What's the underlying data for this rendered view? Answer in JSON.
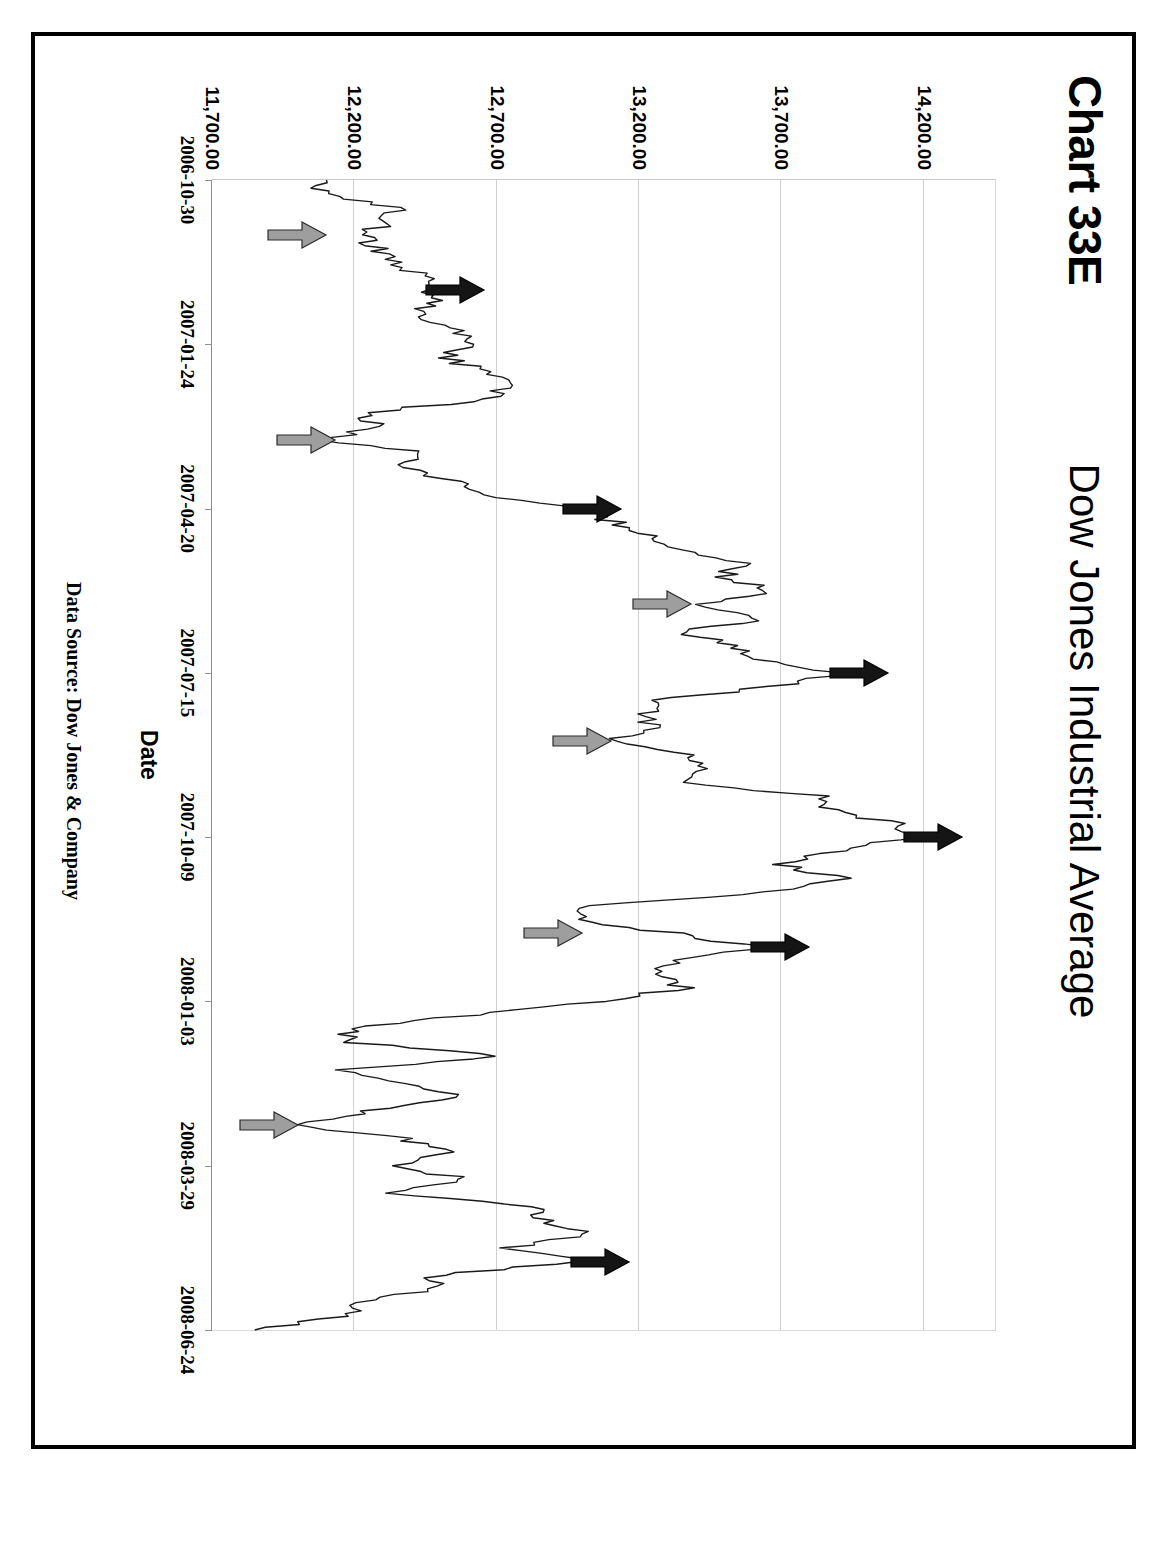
{
  "figure": {
    "chart_number": "Chart 33E",
    "title": "Dow Jones Industrial Average",
    "source_note": "Data Source:  Dow Jones & Company"
  },
  "chart_data": {
    "type": "line",
    "title": "Dow Jones Industrial Average",
    "xlabel": "Date",
    "ylabel": "Dow Industrials",
    "grid": true,
    "legend": "none",
    "orientation": "rotated-90-ccw",
    "ylim": [
      11700,
      14450
    ],
    "ytick_labels": [
      "14,200.00",
      "13,700.00",
      "13,200.00",
      "12,700.00",
      "12,200.00",
      "11,700.00"
    ],
    "ytick_values": [
      14200,
      13700,
      13200,
      12700,
      12200,
      11700
    ],
    "xtick_labels": [
      "2006-10-30",
      "2007-01-24",
      "2007-04-20",
      "2007-07-15",
      "2007-10-09",
      "2008-01-03",
      "2008-03-29",
      "2008-06-24"
    ],
    "series_name": "Dow Jones Industrial Average daily close",
    "x": [
      "2006-10-30",
      "2006-11-06",
      "2006-11-13",
      "2006-11-20",
      "2006-11-27",
      "2006-12-04",
      "2006-12-11",
      "2006-12-18",
      "2006-12-26",
      "2007-01-03",
      "2007-01-10",
      "2007-01-17",
      "2007-01-24",
      "2007-01-31",
      "2007-02-07",
      "2007-02-14",
      "2007-02-22",
      "2007-03-01",
      "2007-03-08",
      "2007-03-15",
      "2007-03-22",
      "2007-03-29",
      "2007-04-05",
      "2007-04-13",
      "2007-04-20",
      "2007-04-27",
      "2007-05-04",
      "2007-05-11",
      "2007-05-18",
      "2007-05-25",
      "2007-06-04",
      "2007-06-11",
      "2007-06-18",
      "2007-06-25",
      "2007-07-02",
      "2007-07-09",
      "2007-07-15",
      "2007-07-23",
      "2007-07-30",
      "2007-08-06",
      "2007-08-13",
      "2007-08-20",
      "2007-08-27",
      "2007-09-04",
      "2007-09-11",
      "2007-09-18",
      "2007-09-25",
      "2007-10-02",
      "2007-10-09",
      "2007-10-16",
      "2007-10-23",
      "2007-10-30",
      "2007-11-06",
      "2007-11-13",
      "2007-11-20",
      "2007-11-28",
      "2007-12-05",
      "2007-12-12",
      "2007-12-19",
      "2007-12-27",
      "2008-01-03",
      "2008-01-10",
      "2008-01-17",
      "2008-01-25",
      "2008-02-01",
      "2008-02-08",
      "2008-02-15",
      "2008-02-25",
      "2008-03-03",
      "2008-03-10",
      "2008-03-18",
      "2008-03-26",
      "2008-03-29",
      "2008-04-04",
      "2008-04-11",
      "2008-04-18",
      "2008-04-25",
      "2008-05-02",
      "2008-05-09",
      "2008-05-16",
      "2008-05-23",
      "2008-06-02",
      "2008-06-09",
      "2008-06-16",
      "2008-06-24"
    ],
    "values": [
      12080,
      12105,
      12340,
      12320,
      12220,
      12290,
      12320,
      12450,
      12480,
      12470,
      12420,
      12560,
      12620,
      12520,
      12650,
      12740,
      12690,
      12230,
      12280,
      12110,
      12460,
      12350,
      12560,
      12610,
      12960,
      13120,
      13260,
      13330,
      13560,
      13500,
      13680,
      13420,
      13640,
      13360,
      13530,
      13610,
      13900,
      13680,
      13270,
      13230,
      13240,
      13080,
      13380,
      13450,
      13310,
      13850,
      13880,
      14090,
      14160,
      13900,
      13680,
      13900,
      13660,
      13010,
      12980,
      13310,
      13620,
      13340,
      13230,
      13360,
      13050,
      12600,
      12160,
      12210,
      12740,
      12180,
      12350,
      12570,
      12260,
      11980,
      12360,
      12550,
      12320,
      12600,
      12330,
      12850,
      12870,
      13020,
      12750,
      12990,
      12480,
      12500,
      12210,
      12160,
      11850
    ],
    "annotations": {
      "peak_arrows_black": [
        {
          "label": "peak-1",
          "date": "2006-12-26",
          "value": 12480
        },
        {
          "label": "peak-2",
          "date": "2007-04-20",
          "value": 12960
        },
        {
          "label": "peak-3",
          "date": "2007-07-15",
          "value": 13900
        },
        {
          "label": "peak-4",
          "date": "2007-10-09",
          "value": 14160
        },
        {
          "label": "peak-5",
          "date": "2007-12-05",
          "value": 13620
        },
        {
          "label": "peak-6",
          "date": "2008-05-16",
          "value": 12990
        }
      ],
      "trough_arrows_gray": [
        {
          "label": "trough-1",
          "date": "2006-11-27",
          "value": 12080
        },
        {
          "label": "trough-2",
          "date": "2007-03-15",
          "value": 12110
        },
        {
          "label": "trough-3",
          "date": "2007-06-11",
          "value": 13360
        },
        {
          "label": "trough-4",
          "date": "2007-08-20",
          "value": 13080
        },
        {
          "label": "trough-5",
          "date": "2007-11-28",
          "value": 12980
        },
        {
          "label": "trough-6",
          "date": "2008-03-10",
          "value": 11980
        }
      ]
    },
    "colors": {
      "line": "#1a1a1a",
      "grid": "#cfcfcf",
      "axis": "#8c8c8c",
      "peak_arrow": "#151515",
      "trough_arrow": "#9e9e9e",
      "frame": "#000000"
    }
  }
}
